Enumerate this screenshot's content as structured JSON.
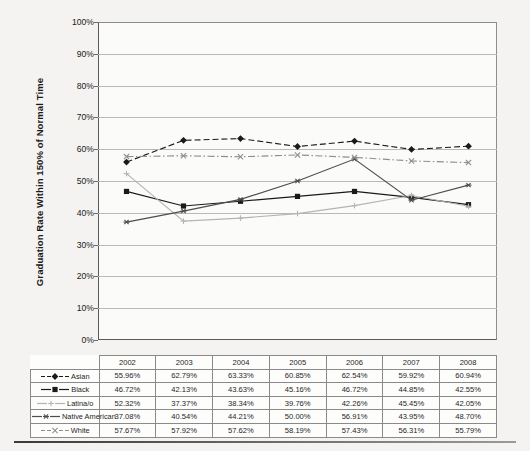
{
  "chart_data": {
    "type": "line",
    "title": "",
    "xlabel": "",
    "ylabel": "Graduation Rate Within 150% of Normal Time",
    "ylim": [
      0,
      100
    ],
    "ytick_labels": [
      "100%",
      "90%",
      "80%",
      "70%",
      "60%",
      "50%",
      "40%",
      "30%",
      "20%",
      "10%",
      "0%"
    ],
    "grid": true,
    "legend_position": "table-left",
    "categories": [
      "2002",
      "2003",
      "2004",
      "2005",
      "2006",
      "2007",
      "2008"
    ],
    "series": [
      {
        "name": "Asian",
        "marker": "diamond",
        "line_style": "dashed",
        "color": "#1a1a1a",
        "values": [
          55.96,
          62.79,
          63.33,
          60.85,
          62.54,
          59.92,
          60.94
        ],
        "labels": [
          "55.96%",
          "62.79%",
          "63.33%",
          "60.85%",
          "62.54%",
          "59.92%",
          "60.94%"
        ]
      },
      {
        "name": "Black",
        "marker": "square",
        "line_style": "solid",
        "color": "#1a1a1a",
        "values": [
          46.72,
          42.13,
          43.63,
          45.16,
          46.72,
          44.85,
          42.55
        ],
        "labels": [
          "46.72%",
          "42.13%",
          "43.63%",
          "45.16%",
          "46.72%",
          "44.85%",
          "42.55%"
        ]
      },
      {
        "name": "Latina/o",
        "marker": "plus",
        "line_style": "solid",
        "color": "#b4b4b4",
        "values": [
          52.32,
          37.37,
          38.34,
          39.76,
          42.26,
          45.45,
          42.05
        ],
        "labels": [
          "52.32%",
          "37.37%",
          "38.34%",
          "39.76%",
          "42.26%",
          "45.45%",
          "42.05%"
        ]
      },
      {
        "name": "Native American",
        "marker": "asterisk",
        "line_style": "solid",
        "color": "#4d4d4d",
        "values": [
          37.08,
          40.54,
          44.21,
          50.0,
          56.91,
          43.95,
          48.7
        ],
        "labels": [
          "37.08%",
          "40.54%",
          "44.21%",
          "50.00%",
          "56.91%",
          "43.95%",
          "48.70%"
        ]
      },
      {
        "name": "White",
        "marker": "x",
        "line_style": "dashdot",
        "color": "#8f8f8f",
        "values": [
          57.67,
          57.92,
          57.62,
          58.19,
          57.43,
          56.31,
          55.79
        ],
        "labels": [
          "57.67%",
          "57.92%",
          "57.62%",
          "58.19%",
          "57.43%",
          "56.31%",
          "55.79%"
        ]
      }
    ]
  },
  "table": {
    "corner_label": "",
    "header": [
      "2002",
      "2003",
      "2004",
      "2005",
      "2006",
      "2007",
      "2008"
    ],
    "rows": [
      {
        "label": "Asian",
        "values": [
          "55.96%",
          "62.79%",
          "63.33%",
          "60.85%",
          "62.54%",
          "59.92%",
          "60.94%"
        ]
      },
      {
        "label": "Black",
        "values": [
          "46.72%",
          "42.13%",
          "43.63%",
          "45.16%",
          "46.72%",
          "44.85%",
          "42.55%"
        ]
      },
      {
        "label": "Latina/o",
        "values": [
          "52.32%",
          "37.37%",
          "38.34%",
          "39.76%",
          "42.26%",
          "45.45%",
          "42.05%"
        ]
      },
      {
        "label": "Native American",
        "values": [
          "37.08%",
          "40.54%",
          "44.21%",
          "50.00%",
          "56.91%",
          "43.95%",
          "48.70%"
        ]
      },
      {
        "label": "White",
        "values": [
          "57.67%",
          "57.92%",
          "57.62%",
          "58.19%",
          "57.43%",
          "56.31%",
          "55.79%"
        ]
      }
    ]
  }
}
